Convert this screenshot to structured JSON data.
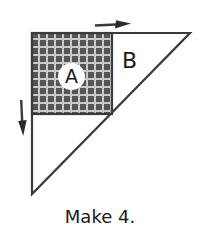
{
  "figure": {
    "caption": "Make 4.",
    "labels": {
      "patch_a": "A",
      "patch_b": "B"
    },
    "colors": {
      "outline": "#3a3a3a",
      "fabric_dark": "#555555",
      "fabric_light": "#c9c9c9",
      "background": "#ffffff",
      "text": "#1a1a1a"
    },
    "shapes": {
      "triangle": {
        "name": "large-right-triangle",
        "points": "32,33 190,33 32,194"
      },
      "square": {
        "name": "fabric-square-a",
        "x": 32,
        "y": 33,
        "width": 80,
        "height": 81
      }
    },
    "arrows": {
      "top": {
        "name": "arrow-right",
        "direction": "right",
        "x1": 95,
        "y1": 25,
        "x2": 130,
        "y2": 22
      },
      "left": {
        "name": "arrow-down",
        "direction": "down",
        "x1": 21,
        "y1": 100,
        "x2": 23,
        "y2": 135
      }
    }
  }
}
